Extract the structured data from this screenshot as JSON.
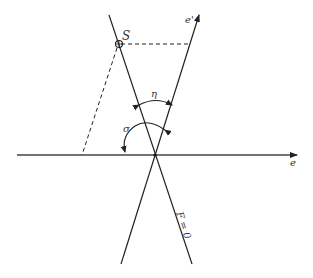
{
  "diagram": {
    "type": "geometric-angle-diagram",
    "labels": {
      "point_s": "S",
      "axis_e_prime": "e'",
      "axis_e": "e",
      "angle_eta": "η",
      "angle_sigma": "σ",
      "line_f": "F = 0"
    },
    "colors": {
      "line": "#222222",
      "background": "#ffffff"
    }
  }
}
